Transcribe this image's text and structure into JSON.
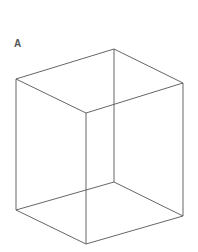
{
  "figure": {
    "label": "A",
    "stroke_color": "#555555",
    "vertices": {
      "top_left": [
        16,
        79
      ],
      "top_back": [
        114,
        49
      ],
      "top_right": [
        183,
        83
      ],
      "top_front": [
        86,
        113
      ],
      "bottom_left": [
        16,
        210
      ],
      "bottom_back": [
        114,
        182
      ],
      "bottom_right": [
        183,
        216
      ],
      "bottom_front": [
        86,
        244
      ]
    }
  }
}
